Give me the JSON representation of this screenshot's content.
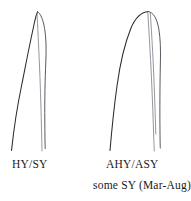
{
  "figure": {
    "type": "feather-aging-diagram",
    "background_color": "#ffffff",
    "ink_color": "#2b2b2f",
    "rachis_color": "#7a7a84",
    "panels": [
      {
        "id": "left",
        "shape_description": "narrow tapered pointed rectrix tip",
        "label_primary": "HY/SY",
        "label_secondary": ""
      },
      {
        "id": "right",
        "shape_description": "broad truncate rounded rectrix tip",
        "label_primary": "AHY/ASY",
        "label_secondary": "some SY (Mar-Aug)"
      }
    ]
  },
  "captions": {
    "left_label": "HY/SY",
    "right_label": "AHY/ASY",
    "right_note": "some SY (Mar-Aug)"
  }
}
